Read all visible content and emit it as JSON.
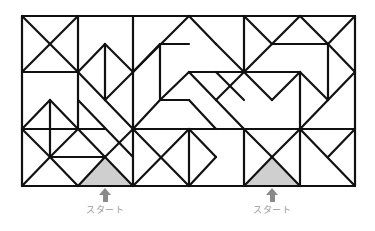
{
  "puzzle": {
    "type": "maze-of-triangles",
    "grid": {
      "cols": 6,
      "rows": 3,
      "x": [
        22,
        78,
        133,
        189,
        244,
        300,
        355
      ],
      "y": [
        16,
        72,
        129,
        186
      ]
    },
    "line_color": "#111111",
    "start_fill": "#cfcfcf",
    "segments": [
      [
        22,
        16,
        355,
        16
      ],
      [
        22,
        186,
        355,
        186
      ],
      [
        22,
        16,
        22,
        186
      ],
      [
        355,
        16,
        355,
        186
      ],
      [
        22,
        72,
        78,
        72
      ],
      [
        78,
        16,
        78,
        72
      ],
      [
        22,
        16,
        78,
        72
      ],
      [
        78,
        16,
        22,
        72
      ],
      [
        133,
        16,
        133,
        129
      ],
      [
        78,
        72,
        78,
        129
      ],
      [
        78,
        72,
        105,
        44
      ],
      [
        105,
        44,
        133,
        72
      ],
      [
        105,
        44,
        105,
        100
      ],
      [
        78,
        72,
        105,
        100
      ],
      [
        133,
        72,
        105,
        100
      ],
      [
        133,
        72,
        189,
        16
      ],
      [
        133,
        72,
        160,
        44
      ],
      [
        160,
        44,
        160,
        100
      ],
      [
        160,
        44,
        189,
        44
      ],
      [
        189,
        16,
        216,
        44
      ],
      [
        216,
        44,
        244,
        72
      ],
      [
        244,
        72,
        272,
        44
      ],
      [
        272,
        44,
        300,
        16
      ],
      [
        244,
        16,
        244,
        72
      ],
      [
        244,
        16,
        272,
        44
      ],
      [
        272,
        44,
        300,
        44
      ],
      [
        300,
        16,
        328,
        44
      ],
      [
        328,
        44,
        355,
        16
      ],
      [
        300,
        44,
        328,
        44
      ],
      [
        328,
        44,
        328,
        100
      ],
      [
        328,
        44,
        355,
        72
      ],
      [
        328,
        100,
        355,
        72
      ],
      [
        300,
        129,
        328,
        100
      ],
      [
        189,
        72,
        244,
        72
      ],
      [
        160,
        100,
        189,
        72
      ],
      [
        189,
        72,
        216,
        100
      ],
      [
        216,
        100,
        244,
        72
      ],
      [
        216,
        72,
        244,
        100
      ],
      [
        160,
        100,
        189,
        100
      ],
      [
        160,
        100,
        133,
        129
      ],
      [
        189,
        100,
        216,
        129
      ],
      [
        216,
        100,
        244,
        129
      ],
      [
        244,
        72,
        300,
        72
      ],
      [
        272,
        100,
        244,
        72
      ],
      [
        272,
        100,
        300,
        72
      ],
      [
        300,
        72,
        300,
        129
      ],
      [
        300,
        72,
        328,
        100
      ],
      [
        22,
        129,
        105,
        129
      ],
      [
        105,
        100,
        133,
        129
      ],
      [
        22,
        129,
        50,
        100
      ],
      [
        50,
        100,
        78,
        129
      ],
      [
        50,
        100,
        50,
        157
      ],
      [
        78,
        129,
        105,
        157
      ],
      [
        105,
        157,
        133,
        129
      ],
      [
        22,
        129,
        50,
        157
      ],
      [
        50,
        157,
        78,
        129
      ],
      [
        50,
        157,
        22,
        186
      ],
      [
        50,
        157,
        78,
        186
      ],
      [
        50,
        157,
        105,
        157
      ],
      [
        78,
        186,
        105,
        157
      ],
      [
        105,
        157,
        133,
        186
      ],
      [
        78,
        100,
        133,
        157
      ],
      [
        133,
        129,
        355,
        129
      ],
      [
        133,
        129,
        133,
        186
      ],
      [
        133,
        129,
        189,
        186
      ],
      [
        189,
        129,
        133,
        186
      ],
      [
        189,
        129,
        189,
        186
      ],
      [
        189,
        129,
        216,
        157
      ],
      [
        216,
        157,
        189,
        186
      ],
      [
        244,
        129,
        244,
        186
      ],
      [
        244,
        186,
        272,
        157
      ],
      [
        272,
        157,
        300,
        186
      ],
      [
        272,
        157,
        300,
        129
      ],
      [
        244,
        129,
        272,
        157
      ],
      [
        300,
        129,
        300,
        186
      ],
      [
        300,
        129,
        355,
        186
      ],
      [
        328,
        157,
        355,
        129
      ]
    ],
    "start_triangles": [
      {
        "points": "78,186 105,157 133,186"
      },
      {
        "points": "244,186 272,157 300,186"
      }
    ]
  },
  "start_markers": [
    {
      "label": "スタート",
      "x": 75,
      "y": 188
    },
    {
      "label": "スタート",
      "x": 242,
      "y": 188
    }
  ]
}
